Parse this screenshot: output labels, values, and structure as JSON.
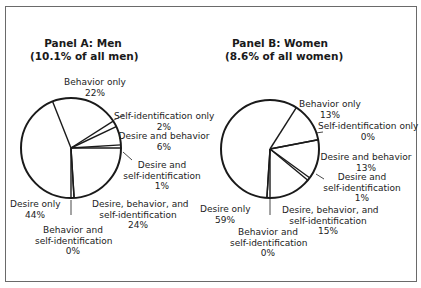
{
  "chart_data": [
    {
      "type": "pie",
      "title": "Panel A: Men",
      "subtitle": "(10.1% of all men)",
      "start_angle_deg": 180,
      "direction": "counterclockwise-from-bottom",
      "slices": [
        {
          "label": "Desire only",
          "value": 44
        },
        {
          "label": "Behavior only",
          "value": 22
        },
        {
          "label": "Self-identification only",
          "value": 2
        },
        {
          "label": "Desire and behavior",
          "value": 6
        },
        {
          "label": "Desire and self-identification",
          "value": 1
        },
        {
          "label": "Desire, behavior, and self-identification",
          "value": 24
        },
        {
          "label": "Behavior and self-identification",
          "value": 0
        }
      ]
    },
    {
      "type": "pie",
      "title": "Panel B: Women",
      "subtitle": "(8.6% of all women)",
      "start_angle_deg": 180,
      "direction": "counterclockwise-from-bottom",
      "slices": [
        {
          "label": "Desire only",
          "value": 59
        },
        {
          "label": "Behavior only",
          "value": 13
        },
        {
          "label": "Self-identification only",
          "value": 0
        },
        {
          "label": "Desire and behavior",
          "value": 13
        },
        {
          "label": "Desire and self-identification",
          "value": 1
        },
        {
          "label": "Desire, behavior, and self-identification",
          "value": 15
        },
        {
          "label": "Behavior and self-identification",
          "value": 0
        }
      ]
    }
  ],
  "panelA": {
    "title": "Panel A: Men",
    "subtitle": "(10.1% of all men)",
    "labels": {
      "behavior_only": [
        "Behavior only",
        "22%"
      ],
      "self_id_only": [
        "Self-identification only",
        "2%"
      ],
      "desire_behavior": [
        "Desire and behavior",
        "6%"
      ],
      "desire_selfid": [
        "Desire and",
        "self-identification",
        "1%"
      ],
      "dbs": [
        "Desire, behavior, and",
        "self-identification",
        "24%"
      ],
      "desire_only": [
        "Desire only",
        "44%"
      ],
      "behavior_selfid": [
        "Behavior and",
        "self-identification",
        "0%"
      ]
    }
  },
  "panelB": {
    "title": "Panel B: Women",
    "subtitle": "(8.6% of all women)",
    "labels": {
      "behavior_only": [
        "Behavior only",
        "13%"
      ],
      "self_id_only": [
        "Self-identification only",
        "0%"
      ],
      "desire_behavior": [
        "Desire and behavior",
        "13%"
      ],
      "desire_selfid": [
        "Desire and",
        "self-identification",
        "1%"
      ],
      "dbs": [
        "Desire, behavior, and",
        "self-identification",
        "15%"
      ],
      "desire_only": [
        "Desire only",
        "59%"
      ],
      "behavior_selfid": [
        "Behavior and",
        "self-identification",
        "0%"
      ]
    }
  },
  "colors": {
    "stroke": "#1a1a1a",
    "frame": "#6a6a6a",
    "fill": "#ffffff"
  }
}
